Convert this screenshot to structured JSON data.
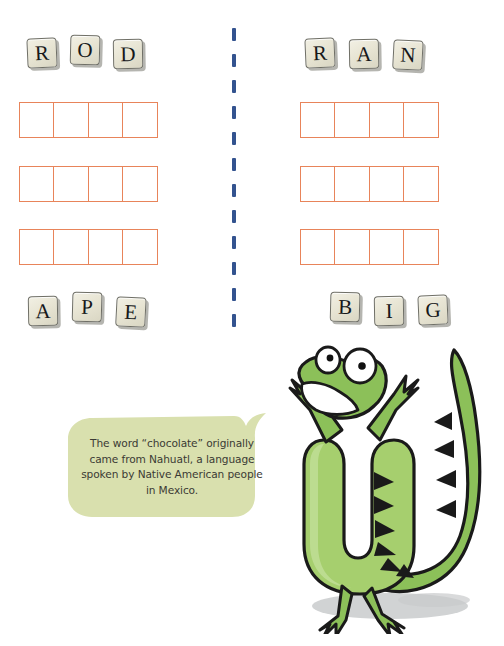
{
  "page": {
    "background_color": "#ffffff",
    "width": 504,
    "height": 646
  },
  "divider": {
    "name": "vertical-dashed-divider",
    "color": "#33538f",
    "orientation": "vertical",
    "dash_count": 12
  },
  "puzzle": {
    "columns": [
      {
        "id": "left",
        "top_word": {
          "letters": [
            "R",
            "O",
            "D"
          ]
        },
        "grids": [
          {
            "cells": [
              "",
              "",
              "",
              ""
            ]
          },
          {
            "cells": [
              "",
              "",
              "",
              ""
            ]
          },
          {
            "cells": [
              "",
              "",
              "",
              ""
            ]
          }
        ],
        "bottom_word": {
          "letters": [
            "A",
            "P",
            "E"
          ]
        }
      },
      {
        "id": "right",
        "top_word": {
          "letters": [
            "R",
            "A",
            "N"
          ]
        },
        "grids": [
          {
            "cells": [
              "",
              "",
              "",
              ""
            ]
          },
          {
            "cells": [
              "",
              "",
              "",
              ""
            ]
          },
          {
            "cells": [
              "",
              "",
              "",
              ""
            ]
          }
        ],
        "bottom_word": {
          "letters": [
            "B",
            "I",
            "G"
          ]
        }
      }
    ],
    "grid_border_color": "#e8845a",
    "tile_face_color": "#ece9da",
    "tile_border_color": "#6f6f66"
  },
  "fact_bubble": {
    "text": "The word “chocolate” originally came from Nahuatl, a language spoken by Native American people in Mexico.",
    "fill_color": "#d9e0ae",
    "text_color": "#3b3a34"
  },
  "mascot": {
    "name": "green-lizard-mascot",
    "body_color": "#8cc059",
    "body_light_color": "#b8d98a",
    "outline_color": "#1a1a1a",
    "eye_color": "#ffffff",
    "pupil_color": "#111111",
    "spike_color": "#1a1a1a",
    "shadow_color": "#c9cbcc",
    "pose": "standing-arms-raised"
  }
}
